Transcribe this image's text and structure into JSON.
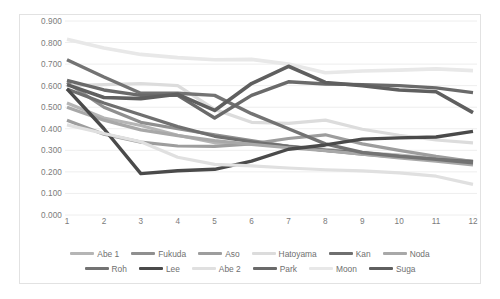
{
  "chart_data": {
    "type": "line",
    "title": "",
    "subtitle": "",
    "xlabel": "",
    "ylabel": "",
    "x": [
      1,
      2,
      3,
      4,
      5,
      6,
      7,
      8,
      9,
      10,
      11,
      12
    ],
    "categories": [
      "1",
      "2",
      "3",
      "4",
      "5",
      "6",
      "7",
      "8",
      "9",
      "10",
      "11",
      "12"
    ],
    "xlim": [
      1,
      12
    ],
    "ylim": [
      0.0,
      0.9
    ],
    "ytick_labels": [
      "0.900",
      "0.800",
      "0.700",
      "0.600",
      "0.500",
      "0.400",
      "0.300",
      "0.200",
      "0.100",
      "0.000"
    ],
    "ytick_values": [
      0.9,
      0.8,
      0.7,
      0.6,
      0.5,
      0.4,
      0.3,
      0.2,
      0.1,
      0.0
    ],
    "grid": true,
    "grid_color": "#eeeeee",
    "legend_position": "bottom",
    "plot_background": "#ffffff",
    "border_color": "#e2e2e2",
    "series": [
      {
        "name": "Abe 1",
        "color": "#b5b5b5",
        "width": 3.2,
        "values": [
          0.52,
          0.45,
          0.415,
          0.37,
          0.335,
          0.33,
          0.32,
          0.305,
          0.29,
          0.278,
          0.262,
          0.25
        ]
      },
      {
        "name": "Fukuda",
        "color": "#8f8f8f",
        "width": 3.2,
        "values": [
          0.615,
          0.5,
          0.43,
          0.4,
          0.372,
          0.345,
          0.318,
          0.3,
          0.282,
          0.268,
          0.255,
          0.24
        ]
      },
      {
        "name": "Aso",
        "color": "#9d9d9d",
        "width": 3.2,
        "values": [
          0.44,
          0.375,
          0.338,
          0.32,
          0.318,
          0.33,
          0.355,
          0.372,
          0.33,
          0.3,
          0.272,
          0.248
        ]
      },
      {
        "name": "Hatoyama",
        "color": "#dcdcdc",
        "width": 3.2,
        "values": [
          0.6,
          0.605,
          0.61,
          0.6,
          0.49,
          0.43,
          0.425,
          0.44,
          0.398,
          0.37,
          0.348,
          0.335
        ]
      },
      {
        "name": "Kan",
        "color": "#6f6f6f",
        "width": 3.2,
        "values": [
          0.585,
          0.52,
          0.465,
          0.41,
          0.365,
          0.34,
          0.318,
          0.3,
          0.288,
          0.272,
          0.258,
          0.248
        ]
      },
      {
        "name": "Noda",
        "color": "#a8a8a8",
        "width": 3.2,
        "values": [
          0.5,
          0.44,
          0.395,
          0.368,
          0.345,
          0.328,
          0.312,
          0.298,
          0.282,
          0.265,
          0.25,
          0.232
        ]
      },
      {
        "name": "Roh",
        "color": "#737373",
        "width": 3.4,
        "values": [
          0.72,
          0.64,
          0.565,
          0.565,
          0.555,
          0.47,
          0.4,
          0.33,
          0.29,
          0.272,
          0.258,
          0.242
        ]
      },
      {
        "name": "Lee",
        "color": "#4a4a4a",
        "width": 3.4,
        "values": [
          0.585,
          0.4,
          0.192,
          0.205,
          0.212,
          0.25,
          0.305,
          0.325,
          0.352,
          0.358,
          0.362,
          0.388
        ]
      },
      {
        "name": "Abe 2",
        "color": "#e0e0e0",
        "width": 3.2,
        "values": [
          0.418,
          0.378,
          0.34,
          0.268,
          0.235,
          0.228,
          0.218,
          0.21,
          0.205,
          0.195,
          0.18,
          0.142
        ]
      },
      {
        "name": "Park",
        "color": "#6a6a6a",
        "width": 3.4,
        "values": [
          0.625,
          0.58,
          0.555,
          0.555,
          0.45,
          0.555,
          0.618,
          0.608,
          0.605,
          0.6,
          0.59,
          0.568
        ]
      },
      {
        "name": "Moon",
        "color": "#e8e8e8",
        "width": 3.6,
        "values": [
          0.815,
          0.775,
          0.745,
          0.73,
          0.72,
          0.722,
          0.7,
          0.66,
          0.668,
          0.672,
          0.678,
          0.67
        ]
      },
      {
        "name": "Suga",
        "color": "#5f5f5f",
        "width": 3.6,
        "values": [
          0.605,
          0.545,
          0.54,
          0.56,
          0.485,
          0.61,
          0.69,
          0.615,
          0.6,
          0.58,
          0.572,
          0.475
        ]
      }
    ]
  }
}
